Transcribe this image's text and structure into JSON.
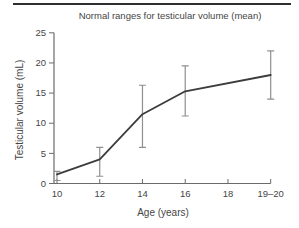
{
  "page": {
    "background": "#ffffff",
    "top_rule_color": "#2f2f2f"
  },
  "chart_data": {
    "type": "line",
    "title": "Normal ranges for testicular volume (mean)",
    "xlabel": "Age (years)",
    "ylabel": "Testicular volume (mL)",
    "x_tick_labels": [
      "10",
      "12",
      "14",
      "16",
      "18",
      "19–20"
    ],
    "y_tick_labels": [
      "0",
      "5",
      "10",
      "15",
      "20",
      "25"
    ],
    "y_tick_values": [
      0,
      5,
      10,
      15,
      20,
      25
    ],
    "ylim": [
      0,
      25
    ],
    "grid": false,
    "error_bars": true,
    "legend": "none",
    "series": [
      {
        "name": "mean testicular volume",
        "points": [
          {
            "x_label": "10",
            "x_tick_index": 0,
            "mean": 1.5,
            "low": 0.5,
            "high": 2.0
          },
          {
            "x_label": "12",
            "x_tick_index": 1,
            "mean": 4.0,
            "low": 1.2,
            "high": 6.0
          },
          {
            "x_label": "14",
            "x_tick_index": 2,
            "mean": 11.5,
            "low": 6.0,
            "high": 16.3
          },
          {
            "x_label": "16",
            "x_tick_index": 3,
            "mean": 15.3,
            "low": 11.2,
            "high": 19.5
          },
          {
            "x_label": "19–20",
            "x_tick_index": 5,
            "mean": 18.0,
            "low": 14.0,
            "high": 22.0
          }
        ]
      }
    ],
    "colors": {
      "line": "#3c3c3c",
      "error_bar": "#8f8f8f",
      "axis": "#6b6b6b",
      "text": "#454545"
    }
  }
}
